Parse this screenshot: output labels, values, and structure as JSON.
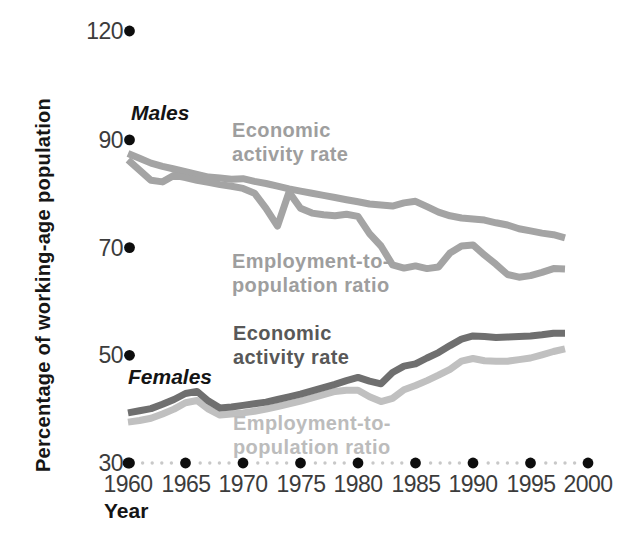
{
  "labels": {
    "males": "Males",
    "females": "Females",
    "year_axis": "Year",
    "y_axis_title": "Percentage of working-age population",
    "activity_line1": "Economic",
    "activity_line2": "activity rate",
    "employment_line1": "Employment-to-",
    "employment_line2": "population ratio"
  },
  "colors": {
    "male_lines": "#a4a4a4",
    "female_activity_line": "#6f6f6f",
    "female_employment_line": "#c0c0c0",
    "male_series_label": "#9e9e9e",
    "female_activity_label": "#585858",
    "female_employment_label": "#bcbcbc",
    "axis_text": "#3c3c3c",
    "big_dot": "#0d0d0d",
    "small_dot": "#c8c8c8"
  },
  "chart_data": {
    "type": "line",
    "title": "",
    "xlabel": "Year",
    "ylabel": "Percentage of working-age population",
    "x_ticks": [
      1960,
      1965,
      1970,
      1975,
      1980,
      1985,
      1990,
      1995,
      2000
    ],
    "y_ticks": [
      120,
      90,
      70,
      50,
      30
    ],
    "ylim_drawn": [
      30,
      120
    ],
    "grid": false,
    "legend": "inline-labels",
    "x": [
      1960,
      1961,
      1962,
      1963,
      1964,
      1965,
      1966,
      1967,
      1968,
      1969,
      1970,
      1971,
      1972,
      1973,
      1974,
      1975,
      1976,
      1977,
      1978,
      1979,
      1980,
      1981,
      1982,
      1983,
      1984,
      1985,
      1986,
      1987,
      1988,
      1989,
      1990,
      1991,
      1992,
      1993,
      1994,
      1995,
      1996,
      1997,
      1998
    ],
    "series": [
      {
        "name": "Males - Economic activity rate",
        "color_key": "male_lines",
        "values": [
          87.5,
          86.6,
          85.7,
          85.1,
          84.6,
          84.1,
          83.6,
          83.1,
          82.9,
          82.7,
          82.8,
          82.3,
          81.9,
          81.4,
          80.9,
          80.5,
          80.1,
          79.7,
          79.3,
          78.9,
          78.5,
          78.1,
          77.9,
          77.7,
          78.3,
          78.6,
          77.6,
          76.6,
          75.9,
          75.5,
          75.3,
          75.1,
          74.6,
          74.2,
          73.5,
          73.1,
          72.7,
          72.4,
          71.8
        ]
      },
      {
        "name": "Males - Employment-to-population ratio",
        "color_key": "male_lines",
        "values": [
          86.3,
          84.4,
          82.5,
          82.2,
          83.4,
          83.0,
          82.5,
          82.1,
          81.7,
          81.4,
          81.0,
          80.1,
          77.3,
          74.0,
          80.3,
          77.3,
          76.4,
          76.1,
          75.9,
          76.2,
          75.8,
          72.6,
          70.3,
          66.8,
          66.2,
          66.6,
          66.1,
          66.4,
          69.0,
          70.3,
          70.5,
          68.6,
          66.9,
          65.0,
          64.5,
          64.8,
          65.4,
          66.1,
          66.0
        ]
      },
      {
        "name": "Females - Economic activity rate",
        "color_key": "female_activity_line",
        "values": [
          39.3,
          39.7,
          40.1,
          40.9,
          41.8,
          42.9,
          43.3,
          41.5,
          40.2,
          40.4,
          40.7,
          41.0,
          41.3,
          41.8,
          42.3,
          42.8,
          43.4,
          44.0,
          44.6,
          45.3,
          45.9,
          45.2,
          44.7,
          46.8,
          48.0,
          48.4,
          49.5,
          50.5,
          51.8,
          53.0,
          53.6,
          53.5,
          53.3,
          53.4,
          53.5,
          53.6,
          53.8,
          54.1,
          54.1
        ]
      },
      {
        "name": "Females - Employment-to-population ratio",
        "color_key": "female_employment_line",
        "values": [
          37.6,
          37.9,
          38.3,
          39.1,
          40.0,
          41.2,
          41.6,
          40.0,
          38.9,
          39.1,
          39.3,
          39.6,
          40.0,
          40.5,
          41.0,
          41.5,
          42.1,
          42.7,
          43.3,
          43.5,
          43.5,
          42.3,
          41.4,
          42.0,
          43.6,
          44.4,
          45.3,
          46.3,
          47.4,
          48.9,
          49.4,
          49.0,
          48.9,
          48.9,
          49.2,
          49.5,
          50.1,
          50.7,
          51.2
        ]
      }
    ]
  }
}
